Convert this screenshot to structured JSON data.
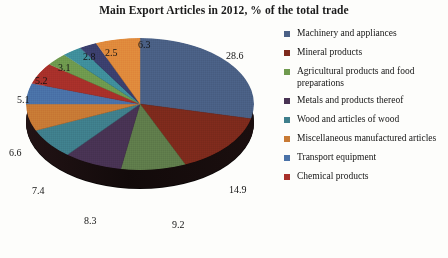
{
  "chart_data": {
    "type": "pie",
    "title": "Main Export Articles in 2012, % of the total trade",
    "xlabel": "",
    "ylabel": "",
    "legend_position": "right",
    "grid": false,
    "categories": [
      "Machinery and appliances",
      "Mineral products",
      "Agricultural products and food preparations",
      "Metals and products thereof",
      "Wood and articles of wood",
      "Miscellaneous manufactured articles",
      "Transport equipment",
      "Chemical products"
    ],
    "values": [
      28.6,
      14.9,
      9.2,
      8.3,
      7.4,
      6.6,
      5.1,
      5.2
    ],
    "slice_labels": [
      "28.6",
      "14.9",
      "9.2",
      "8.3",
      "7.4",
      "6.6",
      "5.1",
      "5.2",
      "3.1",
      "2.8",
      "2.5",
      "6.3"
    ],
    "slices": [
      {
        "label": "28.6",
        "value": 28.6,
        "color": "#4a6085"
      },
      {
        "label": "14.9",
        "value": 14.9,
        "color": "#7d2a1c"
      },
      {
        "label": "9.2",
        "value": 9.2,
        "color": "#5f7c4b"
      },
      {
        "label": "8.3",
        "value": 8.3,
        "color": "#483353"
      },
      {
        "label": "7.4",
        "value": 7.4,
        "color": "#3f7f8c"
      },
      {
        "label": "6.6",
        "value": 6.6,
        "color": "#c87a35"
      },
      {
        "label": "5.1",
        "value": 5.1,
        "color": "#4a72a8"
      },
      {
        "label": "5.2",
        "value": 5.2,
        "color": "#a8302a"
      },
      {
        "label": "3.1",
        "value": 3.1,
        "color": "#6f9a4e"
      },
      {
        "label": "2.8",
        "value": 2.8,
        "color": "#3f8f9c"
      },
      {
        "label": "2.5",
        "value": 2.5,
        "color": "#3b3f6e"
      },
      {
        "label": "6.3",
        "value": 6.3,
        "color": "#e08a3c"
      }
    ]
  },
  "legend": {
    "items": [
      {
        "label": "Machinery and appliances",
        "color": "#4a6085"
      },
      {
        "label": "Mineral products",
        "color": "#7d2a1c"
      },
      {
        "label": "Agricultural products and food preparations",
        "color": "#6f9a4e"
      },
      {
        "label": "Metals and products thereof",
        "color": "#483353"
      },
      {
        "label": "Wood and articles of wood",
        "color": "#3f7f8c"
      },
      {
        "label": "Miscellaneous manufactured articles",
        "color": "#c87a35"
      },
      {
        "label": "Transport equipment",
        "color": "#4a72a8"
      },
      {
        "label": "Chemical products",
        "color": "#a8302a"
      }
    ]
  },
  "labels": {
    "l_286": "28.6",
    "l_149": "14.9",
    "l_92": "9.2",
    "l_83": "8.3",
    "l_74": "7.4",
    "l_66": "6.6",
    "l_51": "5.1",
    "l_52": "5.2",
    "l_31": "3.1",
    "l_28": "2.8",
    "l_25": "2.5",
    "l_63": "6.3"
  }
}
